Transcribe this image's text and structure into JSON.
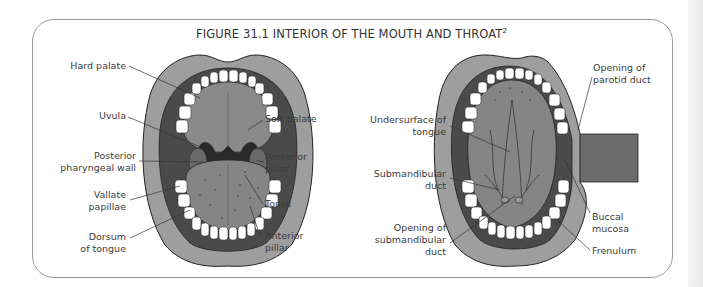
{
  "figure": {
    "title": "FIGURE 31.1 INTERIOR OF THE MOUTH AND THROAT",
    "title_superscript": "2"
  },
  "left_diagram": {
    "name": "open mouth showing palate, pharynx and tongue",
    "labels_left": [
      {
        "id": "hard_palate",
        "lines": [
          "Hard palate"
        ]
      },
      {
        "id": "uvula",
        "lines": [
          "Uvula"
        ]
      },
      {
        "id": "posterior_pharyngeal_wall",
        "lines": [
          "Posterior",
          "pharyngeal wall"
        ]
      },
      {
        "id": "vallate_papillae",
        "lines": [
          "Vallate",
          "papillae"
        ]
      },
      {
        "id": "dorsum_of_tongue",
        "lines": [
          "Dorsum",
          "of tongue"
        ]
      }
    ],
    "labels_right": [
      {
        "id": "soft_palate",
        "lines": [
          "Soft palate"
        ]
      },
      {
        "id": "posterior_pillar",
        "lines": [
          "Posterior",
          "pillar"
        ]
      },
      {
        "id": "tonsil",
        "lines": [
          "Tonsil"
        ]
      },
      {
        "id": "anterior_pillar",
        "lines": [
          "Anterior",
          "pillar"
        ]
      }
    ]
  },
  "right_diagram": {
    "name": "open mouth with tongue raised and cheek retracted",
    "labels_left": [
      {
        "id": "undersurface_of_tongue",
        "lines": [
          "Undersurface of",
          "tongue"
        ]
      },
      {
        "id": "submandibular_duct",
        "lines": [
          "Submandibular",
          "duct"
        ]
      },
      {
        "id": "opening_of_submandibular_duct",
        "lines": [
          "Opening of",
          "submandibular",
          "duct"
        ]
      }
    ],
    "labels_right": [
      {
        "id": "opening_of_parotid_duct",
        "lines": [
          "Opening of",
          "parotid duct"
        ]
      },
      {
        "id": "buccal_mucosa",
        "lines": [
          "Buccal",
          "mucosa"
        ]
      },
      {
        "id": "frenulum",
        "lines": [
          "Frenulum"
        ]
      }
    ]
  },
  "colors": {
    "lip": "#9e9e9e",
    "mouth_dark": "#4a4a4a",
    "palate": "#8a8a8a",
    "tongue": "#858585",
    "throat": "#2a2a2a",
    "teeth": "#ffffff",
    "outline": "#222222",
    "label_text": "#3c3c3c",
    "frame": "#9a9a9a"
  }
}
